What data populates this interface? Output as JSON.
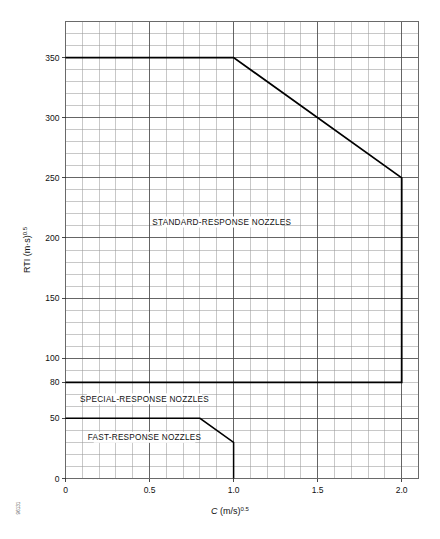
{
  "figure": {
    "reference_number": "96131"
  },
  "chart_data": {
    "type": "line",
    "title": "",
    "subtitle": "",
    "xlabel": "C (m/s)0.5",
    "xlabel_main": "C",
    "xlabel_unit": "(m/s)",
    "xlabel_exp": "0.5",
    "ylabel": "RTI (m·s)0.5",
    "ylabel_main": "RTI",
    "ylabel_unit": "(m·s)",
    "ylabel_exp": "0.5",
    "xlim": [
      0,
      2.1
    ],
    "ylim": [
      0,
      380
    ],
    "grid": true,
    "grid_minor_x_step": 0.1,
    "grid_minor_y_step": 10,
    "legend_position": "inline-annotations",
    "x_tick_labels": [
      "0",
      "0.5",
      "1.0",
      "1.5",
      "2.0"
    ],
    "x_tick_values": [
      0,
      0.5,
      1.0,
      1.5,
      2.0
    ],
    "y_tick_labels": [
      "0",
      "50",
      "80",
      "100",
      "150",
      "200",
      "250",
      "300",
      "350"
    ],
    "y_tick_values": [
      0,
      50,
      80,
      100,
      150,
      200,
      250,
      300,
      350
    ],
    "annotations": [
      {
        "text": "STANDARD-RESPONSE NOZZLES",
        "x": 0.93,
        "y": 212
      },
      {
        "text": "SPECIAL-RESPONSE NOZZLES",
        "x": 0.47,
        "y": 65
      },
      {
        "text": "FAST-RESPONSE NOZZLES",
        "x": 0.47,
        "y": 33
      }
    ],
    "series": [
      {
        "name": "Standard-response nozzle boundary",
        "points": [
          [
            0,
            350
          ],
          [
            1.0,
            350
          ],
          [
            2.0,
            250
          ],
          [
            2.0,
            80
          ],
          [
            0,
            80
          ]
        ],
        "color": "#000000",
        "width": 1.8
      },
      {
        "name": "Fast-response nozzle boundary",
        "points": [
          [
            0,
            50
          ],
          [
            0.8,
            50
          ],
          [
            1.0,
            30
          ],
          [
            1.0,
            0
          ]
        ],
        "color": "#000000",
        "width": 1.5
      }
    ]
  }
}
